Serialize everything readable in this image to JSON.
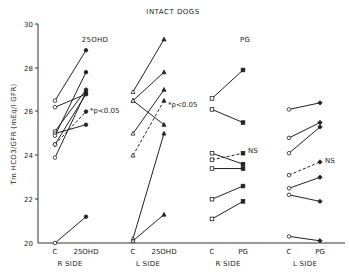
{
  "chart_data": {
    "type": "line",
    "title": "INTACT DOGS",
    "ylabel": "Tm HCO3/GFR (mEq/l GFR)",
    "ylim": [
      20,
      30
    ],
    "yticks": [
      20,
      22,
      24,
      26,
      28,
      30
    ],
    "grid": false,
    "panels": [
      {
        "group_label": "25OHD",
        "side": "R SIDE",
        "x": [
          "C",
          "25OHD"
        ],
        "marker": "circle",
        "series": [
          {
            "values": [
              26.5,
              28.8
            ]
          },
          {
            "values": [
              26.2,
              26.8
            ]
          },
          {
            "values": [
              25.1,
              27.0
            ]
          },
          {
            "values": [
              25.0,
              25.4
            ]
          },
          {
            "values": [
              24.9,
              27.8
            ]
          },
          {
            "values": [
              24.5,
              26.8
            ]
          },
          {
            "values": [
              23.9,
              26.9
            ]
          },
          {
            "values": [
              20.0,
              21.2
            ]
          },
          {
            "values": [
              24.5,
              26.0
            ],
            "dashed": true,
            "annotation": "*p<0.05"
          }
        ]
      },
      {
        "group_label": "",
        "side": "L SIDE",
        "x": [
          "C",
          "25OHD"
        ],
        "marker": "triangle",
        "series": [
          {
            "values": [
              26.9,
              29.3
            ]
          },
          {
            "values": [
              26.5,
              27.8
            ]
          },
          {
            "values": [
              26.5,
              25.4
            ]
          },
          {
            "values": [
              25.0,
              27.0
            ]
          },
          {
            "values": [
              20.2,
              25.0
            ]
          },
          {
            "values": [
              20.1,
              21.3
            ]
          },
          {
            "values": [
              24.0,
              26.5
            ],
            "dashed": true,
            "annotation": "*p<0.05"
          }
        ]
      },
      {
        "group_label": "PG",
        "side": "R SIDE",
        "x": [
          "C",
          "PG"
        ],
        "marker": "square",
        "series": [
          {
            "values": [
              26.6,
              27.9
            ]
          },
          {
            "values": [
              26.1,
              25.5
            ]
          },
          {
            "values": [
              24.1,
              23.6
            ]
          },
          {
            "values": [
              23.4,
              23.4
            ]
          },
          {
            "values": [
              22.0,
              22.6
            ]
          },
          {
            "values": [
              21.1,
              21.9
            ]
          },
          {
            "values": [
              23.8,
              24.1
            ],
            "dashed": true,
            "annotation": "NS"
          }
        ]
      },
      {
        "group_label": "",
        "side": "L SIDE",
        "x": [
          "C",
          "PG"
        ],
        "marker": "diamond",
        "series": [
          {
            "values": [
              26.1,
              26.4
            ]
          },
          {
            "values": [
              24.8,
              25.5
            ]
          },
          {
            "values": [
              24.1,
              25.3
            ]
          },
          {
            "values": [
              22.5,
              23.0
            ]
          },
          {
            "values": [
              22.2,
              21.9
            ]
          },
          {
            "values": [
              20.3,
              20.1
            ]
          },
          {
            "values": [
              23.1,
              23.7
            ],
            "dashed": true,
            "annotation": "NS"
          }
        ]
      }
    ]
  },
  "labels": {
    "title": "INTACT DOGS",
    "ylabel": "Tm HCO3/GFR (mEq/l GFR)",
    "group_25ohd": "25OHD",
    "group_pg": "PG",
    "sig": "*p<0.05",
    "ns": "NS",
    "x_c": "C",
    "x_25ohd": "25OHD",
    "x_pg": "PG",
    "r_side": "R SIDE",
    "l_side": "L SIDE",
    "y20": "20",
    "y22": "22",
    "y24": "24",
    "y26": "26",
    "y28": "28",
    "y30": "30"
  }
}
